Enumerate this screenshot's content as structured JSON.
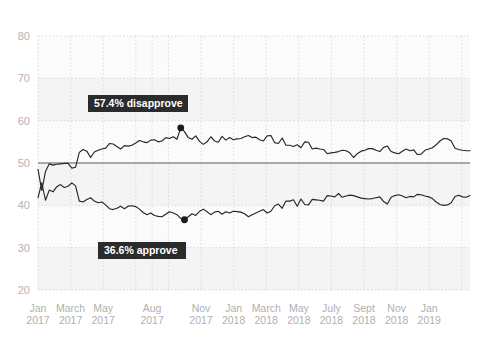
{
  "chart_data": {
    "type": "line",
    "title": "",
    "subtitle": "",
    "xlabel": "",
    "ylabel": "",
    "ylim": [
      20,
      80
    ],
    "yticks": [
      20,
      30,
      40,
      50,
      60,
      70,
      80
    ],
    "ytick_labels": [
      "20",
      "30",
      "40",
      "50",
      "60",
      "70",
      "80"
    ],
    "grid": true,
    "legend_position": "none",
    "reference_line": {
      "value": 50,
      "color": "#8f8f8f"
    },
    "xtick_labels": [
      {
        "month": "Jan",
        "year": "2017"
      },
      {
        "month": "March",
        "year": "2017"
      },
      {
        "month": "May",
        "year": "2017"
      },
      {
        "month": "Aug",
        "year": "2017"
      },
      {
        "month": "Nov",
        "year": "2017"
      },
      {
        "month": "Jan",
        "year": "2018"
      },
      {
        "month": "March",
        "year": "2018"
      },
      {
        "month": "May",
        "year": "2018"
      },
      {
        "month": "July",
        "year": "2018"
      },
      {
        "month": "Sept",
        "year": "2018"
      },
      {
        "month": "Nov",
        "year": "2018"
      },
      {
        "month": "Jan",
        "year": "2019"
      }
    ],
    "xtick_positions": [
      0,
      2,
      4,
      7,
      10,
      12,
      14,
      16,
      18,
      20,
      22,
      24
    ],
    "x_units": "months since Jan 2017",
    "x_range": [
      0,
      26.5
    ],
    "series": [
      {
        "name": "disapprove",
        "color": "#262626",
        "values": [
          48.5,
          43.5,
          48.0,
          49.8,
          49.5,
          49.7,
          49.8,
          49.9,
          49.9,
          48.8,
          49.0,
          52.5,
          53.2,
          52.8,
          51.3,
          52.6,
          53.0,
          53.3,
          53.5,
          54.6,
          54.5,
          53.9,
          53.3,
          54.1,
          54.0,
          54.2,
          54.7,
          55.3,
          55.0,
          54.8,
          55.4,
          55.5,
          55.0,
          55.2,
          56.0,
          55.8,
          56.2,
          55.6,
          58.3,
          57.4,
          56.0,
          55.6,
          56.4,
          55.1,
          54.4,
          55.0,
          56.2,
          55.2,
          54.9,
          56.3,
          55.4,
          56.0,
          55.5,
          55.7,
          55.8,
          56.2,
          56.5,
          56.0,
          56.1,
          55.5,
          55.2,
          56.4,
          56.5,
          54.8,
          54.6,
          55.9,
          54.2,
          54.2,
          53.9,
          54.3,
          53.6,
          55.0,
          54.9,
          53.3,
          53.5,
          53.3,
          53.2,
          52.2,
          52.4,
          52.5,
          52.7,
          53.0,
          52.9,
          52.4,
          51.3,
          52.2,
          52.8,
          53.0,
          53.4,
          53.4,
          53.0,
          52.7,
          53.7,
          54.0,
          52.7,
          52.4,
          52.2,
          52.8,
          53.3,
          52.9,
          53.1,
          52.0,
          52.1,
          53.0,
          53.3,
          53.6,
          54.3,
          55.2,
          55.8,
          55.7,
          55.2,
          53.5,
          53.2,
          53.0,
          52.9,
          52.9
        ]
      },
      {
        "name": "approve",
        "color": "#262626",
        "values": [
          41.8,
          45.3,
          41.2,
          43.6,
          43.2,
          44.4,
          44.9,
          44.2,
          44.5,
          45.3,
          44.6,
          41.0,
          40.8,
          41.4,
          41.8,
          41.0,
          40.6,
          40.8,
          40.1,
          39.2,
          39.0,
          39.3,
          39.8,
          39.2,
          39.8,
          39.9,
          39.7,
          39.1,
          38.3,
          37.8,
          38.2,
          37.6,
          37.4,
          37.3,
          37.9,
          38.5,
          38.2,
          37.8,
          36.9,
          36.6,
          37.3,
          38.0,
          37.6,
          38.6,
          39.1,
          38.5,
          37.8,
          38.4,
          38.6,
          37.9,
          38.5,
          38.2,
          38.6,
          38.5,
          38.4,
          38.0,
          37.3,
          37.8,
          38.2,
          38.6,
          39.0,
          38.2,
          38.6,
          39.9,
          40.3,
          39.3,
          41.0,
          41.0,
          41.3,
          39.8,
          41.5,
          40.2,
          40.1,
          41.4,
          41.3,
          41.2,
          41.0,
          42.3,
          42.2,
          42.0,
          42.8,
          41.9,
          42.2,
          42.4,
          42.3,
          42.0,
          41.7,
          41.6,
          41.5,
          41.6,
          41.8,
          42.0,
          40.9,
          40.3,
          41.9,
          42.3,
          42.5,
          42.2,
          41.8,
          42.1,
          42.0,
          42.6,
          42.5,
          42.2,
          42.0,
          41.6,
          40.8,
          40.2,
          40.0,
          40.1,
          40.6,
          42.1,
          42.4,
          42.0,
          41.9,
          42.3
        ]
      }
    ],
    "annotations": [
      {
        "label": "57.4% disapprove",
        "series": "disapprove",
        "value": 57.4,
        "marker_value": 58.3,
        "marker_index": 38,
        "box_x": 88,
        "box_y": 95,
        "box_w": 100,
        "box_h": 17
      },
      {
        "label": "36.6% approve",
        "series": "approve",
        "value": 36.6,
        "marker_value": 36.6,
        "marker_index": 39,
        "box_x": 98,
        "box_y": 242,
        "box_w": 88,
        "box_h": 17
      }
    ]
  }
}
